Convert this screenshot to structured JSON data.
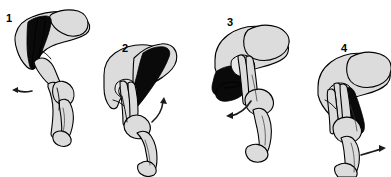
{
  "figure": {
    "background_color": "#ffffff",
    "width": 391,
    "height": 177,
    "bone_fill_color": "#dcdcdc",
    "muscle_fill_color": "#0a0a0a",
    "outline_color": "#000000",
    "arrow_color": "#1a1a1a"
  },
  "panels": [
    {
      "number": "1",
      "number_x": 6,
      "number_y": 22,
      "muscle_label": "iliopsoas-shaded-band",
      "arrow_label": "rotation-arrow-down-left",
      "arrow_direction": "down-left"
    },
    {
      "number": "2",
      "number_x": 122,
      "number_y": 52,
      "muscle_label": "iliopsoas-shaded-band",
      "arrow_label": "rotation-arrow-up",
      "arrow_direction": "up"
    },
    {
      "number": "3",
      "number_x": 227,
      "number_y": 26,
      "muscle_label": "iliopsoas-shaded-band",
      "arrow_label": "rotation-arrow-left",
      "arrow_direction": "left"
    },
    {
      "number": "4",
      "number_x": 341,
      "number_y": 52,
      "muscle_label": "iliopsoas-shaded-band",
      "arrow_label": "rotation-arrow-right",
      "arrow_direction": "right"
    }
  ]
}
